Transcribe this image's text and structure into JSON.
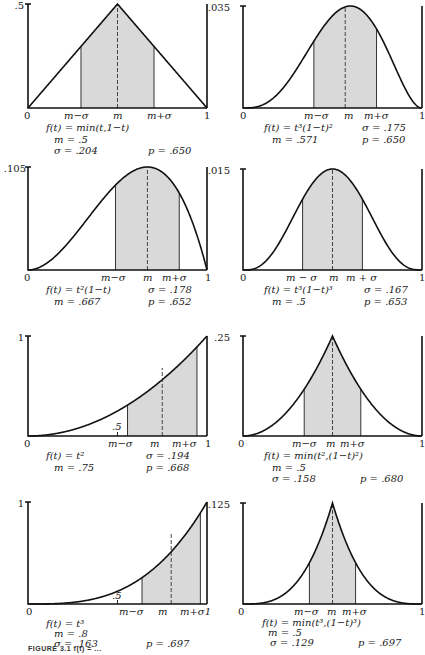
{
  "figure": {
    "caption": "FIGURE 3.1  f(t) = ..."
  },
  "style": {
    "shade": "#d9d9d9",
    "curve": "#111111",
    "axis": "#111111"
  },
  "chart_data": [
    {
      "type": "area",
      "title": "f(t) = min(t,1−t)",
      "func": "tri",
      "ymax_label": ".5",
      "ymax": 0.5,
      "xlim": [
        0,
        1
      ],
      "tick_labels": [
        "0",
        "m−σ",
        "m",
        "m+σ",
        "1"
      ],
      "m": 0.5,
      "sigma": 0.204,
      "p": 0.65,
      "stats": {
        "formula": "f(t) = min(t,1−t)",
        "m": "m = .5",
        "sigma": "σ = .204",
        "p": "p = .650"
      }
    },
    {
      "type": "area",
      "title": "f(t) = t²(1−t)²",
      "func": "t2_1mt2",
      "ymax_label": ".035",
      "ymax": 0.035,
      "xlim": [
        0,
        1
      ],
      "tick_labels": [
        "0",
        "m−σ",
        "m",
        "m+σ",
        "1"
      ],
      "m": 0.571,
      "sigma": 0.175,
      "p": 0.65,
      "stats": {
        "formula": "f(t) = t³(1−t)²",
        "m": "m = .571",
        "sigma": "σ = .175",
        "p": "p = .650"
      }
    },
    {
      "type": "area",
      "title": "f(t) = t²(1−t)",
      "func": "t2_1mt",
      "ymax_label": ".105",
      "ymax": 0.105,
      "xlim": [
        0,
        1
      ],
      "tick_labels": [
        "0",
        "m−σ",
        "m",
        "m+σ",
        "1"
      ],
      "m": 0.667,
      "sigma": 0.178,
      "p": 0.652,
      "stats": {
        "formula": "f(t) = t²(1−t)",
        "m": "m = .667",
        "sigma": "σ = .178",
        "p": "p = .652"
      }
    },
    {
      "type": "area",
      "title": "f(t) = t³(1−t)³",
      "func": "t3_1mt3",
      "ymax_label": ".015",
      "ymax": 0.015,
      "xlim": [
        0,
        1
      ],
      "tick_labels": [
        "0",
        "m − σ",
        "m",
        "m + σ",
        "1"
      ],
      "m": 0.5,
      "sigma": 0.167,
      "p": 0.653,
      "stats": {
        "formula": "f(t) = t³(1−t)³",
        "m": "m = .5",
        "sigma": "σ = .167",
        "p": "p = .653"
      }
    },
    {
      "type": "area",
      "title": "f(t) = t²",
      "func": "t2",
      "ymax_label": "1",
      "ymax": 1,
      "xlim": [
        0,
        1
      ],
      "extra_tick": ".5",
      "tick_labels": [
        "0",
        "m−σ",
        "m",
        "m+σ",
        "1"
      ],
      "m": 0.75,
      "sigma": 0.194,
      "p": 0.668,
      "stats": {
        "formula": "f(t) = t²",
        "m": "m = .75",
        "sigma": "σ = .194",
        "p": "p = .668"
      }
    },
    {
      "type": "area",
      "title": "f(t) = min(t²,(1−t)²)",
      "func": "min_t2",
      "ymax_label": ".25",
      "ymax": 0.25,
      "xlim": [
        0,
        1
      ],
      "tick_labels": [
        "0",
        "m−σ",
        "m",
        "m+σ",
        "1"
      ],
      "m": 0.5,
      "sigma": 0.158,
      "p": 0.68,
      "stats": {
        "formula": "f(t) = min(t²,(1−t)²)",
        "m": "m = .5",
        "sigma": "σ = .158",
        "p": "p = .680"
      }
    },
    {
      "type": "area",
      "title": "f(t) = t³",
      "func": "t3",
      "ymax_label": "1",
      "ymax": 1,
      "xlim": [
        0,
        1
      ],
      "extra_tick": ".5",
      "tick_labels": [
        "0",
        "m−σ",
        "m",
        "m+σ1"
      ],
      "m": 0.8,
      "sigma": 0.163,
      "p": 0.697,
      "stats": {
        "formula": "f(t) = t³",
        "m": "m = .8",
        "sigma": "σ = .163",
        "p": "p = .697"
      }
    },
    {
      "type": "area",
      "title": "f(t) = min(t³,(1−t)³)",
      "func": "min_t3",
      "ymax_label": ".125",
      "ymax": 0.125,
      "xlim": [
        0,
        1
      ],
      "tick_labels": [
        "0",
        "m−σ",
        "m",
        "m+σ",
        "1"
      ],
      "m": 0.5,
      "sigma": 0.129,
      "p": 0.697,
      "stats": {
        "formula": "f(t) = min(t³,(1−t)³)",
        "m": "m = .5",
        "sigma": "σ = .129",
        "p": "p = .697"
      }
    }
  ]
}
